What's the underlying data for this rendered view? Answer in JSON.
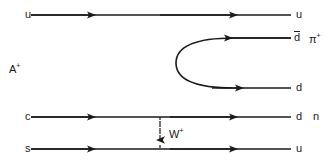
{
  "diagram": {
    "colors": {
      "line": "#1a1a1a",
      "text": "#1a1a1a",
      "background": "#ffffff"
    },
    "left_labels": {
      "u_quark": "u",
      "parent_hadron": "A",
      "parent_hadron_charge": "+",
      "c_quark": "c",
      "s_quark": "s"
    },
    "right_labels": {
      "u_spectator": "u",
      "dbar": "d",
      "pion": "π",
      "pion_charge": "+",
      "d_quark": "d",
      "d_neutron": "d",
      "neutron": "n",
      "u_out": "u"
    },
    "propagator": {
      "boson": "W",
      "boson_charge": "+"
    },
    "fermion_lines": [
      {
        "name": "spectator-u-line",
        "from": "u",
        "to": "u",
        "y": 15,
        "direction": "right"
      },
      {
        "name": "dbar-line",
        "from": "loop",
        "to": "d-bar",
        "y": 38,
        "direction": "left"
      },
      {
        "name": "d-line",
        "from": "loop",
        "to": "d",
        "y": 88,
        "direction": "right"
      },
      {
        "name": "c-to-d-line",
        "from": "c",
        "to": "d",
        "y": 117,
        "direction": "right"
      },
      {
        "name": "s-to-u-line",
        "from": "s",
        "to": "u",
        "y": 149,
        "direction": "right"
      }
    ]
  }
}
